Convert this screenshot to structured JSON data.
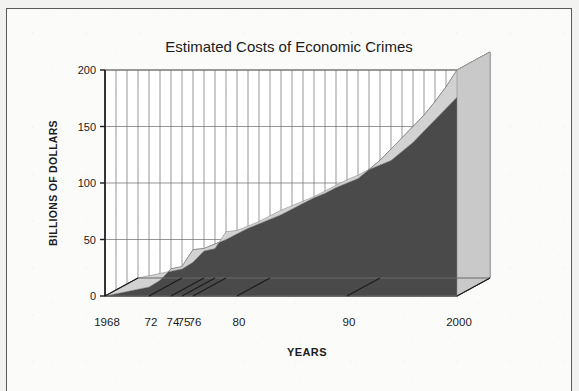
{
  "figure": {
    "frame_color": "#5a5a5a",
    "background_color": "#fbfbfa"
  },
  "chart_data": {
    "type": "area",
    "title": "Estimated Costs of Economic Crimes",
    "xlabel": "YEARS",
    "ylabel": "BILLIONS OF DOLLARS",
    "style": "3d-area",
    "ylim": [
      0,
      200
    ],
    "xlim": [
      1968,
      2000
    ],
    "grid": true,
    "grid_orientation": "vertical-and-horizontal",
    "ytick_labels": [
      "0",
      "50",
      "100",
      "150",
      "200"
    ],
    "ytick_values": [
      0,
      50,
      100,
      150,
      200
    ],
    "xtick_labels": [
      "1968",
      "72",
      "74",
      "75",
      "76",
      "80",
      "90",
      "2000"
    ],
    "xtick_values": [
      1968,
      1972,
      1974,
      1975,
      1976,
      1980,
      1990,
      2000
    ],
    "series": [
      {
        "name": "Estimated Costs of Economic Crimes",
        "fill_color": "#4a4a4a",
        "top_color": "#d2d2d2",
        "x": [
          1968,
          1969,
          1970,
          1971,
          1972,
          1973,
          1974,
          1975,
          1976,
          1977,
          1978,
          1979,
          1980,
          1981,
          1982,
          1983,
          1984,
          1985,
          1986,
          1987,
          1988,
          1989,
          1990,
          1991,
          1992,
          1993,
          1994,
          1995,
          1996,
          1997,
          1998,
          1999,
          2000
        ],
        "values": [
          0,
          2,
          4,
          6,
          8,
          14,
          24,
          26,
          41,
          42,
          46,
          50,
          55,
          60,
          64,
          68,
          72,
          77,
          82,
          87,
          91,
          96,
          100,
          104,
          112,
          120,
          130,
          140,
          150,
          160,
          172,
          185,
          200
        ]
      }
    ],
    "legend": "none",
    "annotations": []
  }
}
